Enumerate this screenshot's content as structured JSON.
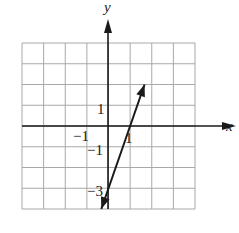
{
  "chart_data": {
    "type": "line",
    "title": "",
    "xlabel": "x",
    "ylabel": "y",
    "xlim": [
      -4,
      4
    ],
    "ylim": [
      -4,
      4
    ],
    "grid": true,
    "grid_step": 1,
    "tick_labels": {
      "x": [
        {
          "value": -1,
          "label": "−1"
        },
        {
          "value": 1,
          "label": "1"
        }
      ],
      "y": [
        {
          "value": 1,
          "label": "1"
        },
        {
          "value": -1,
          "label": "−1"
        },
        {
          "value": -3,
          "label": "−3"
        }
      ]
    },
    "series": [
      {
        "name": "y = 3x - 3",
        "equation": "y = 3x - 3",
        "slope": 3,
        "y_intercept": -3,
        "x_intercept": 1,
        "points": [
          {
            "x": -0.333,
            "y": -4
          },
          {
            "x": 1.667,
            "y": 2
          }
        ],
        "arrows": "both"
      }
    ],
    "colors": {
      "grid": "#a8a8a8",
      "axes": "#1a1a1a",
      "line": "#1a1a1a"
    }
  },
  "labels": {
    "x_axis": "x",
    "y_axis": "y",
    "x_tick_neg1": "−1",
    "x_tick_1": "1",
    "y_tick_1": "1",
    "y_tick_neg1": "−1",
    "y_tick_neg3": "−3"
  }
}
